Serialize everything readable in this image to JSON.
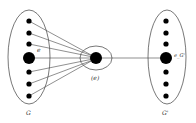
{
  "diagram": {
    "left_set": {
      "label": "G",
      "edge_label": "e"
    },
    "center_node": {
      "label": "(e)"
    },
    "right_set": {
      "label": "G'",
      "node_label": "e_G'"
    },
    "colors": {
      "stroke": "#555555",
      "node": "#000000",
      "background": "#ffffff"
    }
  }
}
